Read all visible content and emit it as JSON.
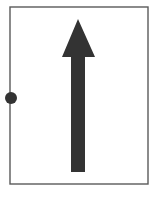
{
  "figure": {
    "background_color": "#ffffff",
    "canvas": {
      "width": 159,
      "height": 201
    }
  },
  "frame": {
    "name": "rectangular-border",
    "x": 10,
    "y": 7,
    "width": 138,
    "height": 177,
    "stroke_color": "#5a5a5a",
    "stroke_width": 1.4,
    "fill_color": "#ffffff"
  },
  "arrow": {
    "name": "up-arrow",
    "direction": "up",
    "fill_color": "#333333",
    "tip": {
      "x": 78,
      "y": 19
    },
    "head": {
      "left_x": 62,
      "right_x": 95,
      "base_y": 57,
      "width": 33,
      "height": 38
    },
    "shaft": {
      "left_x": 71,
      "right_x": 85,
      "top_y": 57,
      "bottom_y": 172,
      "width": 14,
      "height": 115
    },
    "polygon_points": "78,19 95,57 85,57 85,172 71,172 71,57 62,57"
  },
  "dot": {
    "name": "anchor-dot",
    "center_x": 11,
    "center_y": 98,
    "radius": 6,
    "fill_color": "#333333"
  }
}
